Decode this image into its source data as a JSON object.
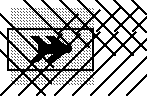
{
  "figure": {
    "canvas": {
      "width": 147,
      "height": 96,
      "background": "#ffffff"
    },
    "colors": {
      "ink": "#000000",
      "hatch": "#1a1a1a",
      "stipple": "#555555",
      "background": "#ffffff"
    },
    "stipple_region": {
      "name": "dotted-fill-region",
      "x": 10,
      "y": 8,
      "width": 84,
      "height": 78,
      "dot_spacing": 3,
      "dot_size": 1,
      "color": "#555555"
    },
    "hatching": {
      "name": "cross-hatch-lines",
      "stroke_width": 2,
      "color": "#000000",
      "down_right_spacing": 18,
      "up_right_spacing": 18,
      "down_right_count": 9,
      "up_right_count": 11
    },
    "rectangle": {
      "name": "outlined-rectangle",
      "x": 8,
      "y": 29,
      "width": 85,
      "height": 41,
      "stroke": "#000000",
      "stroke_width": 2,
      "fill": "none"
    },
    "arrow": {
      "name": "double-chevron-arrow",
      "direction": "right",
      "fill": "#000000",
      "tip_x": 70,
      "tip_y": 49,
      "tail_x": 29,
      "height": 26
    }
  }
}
